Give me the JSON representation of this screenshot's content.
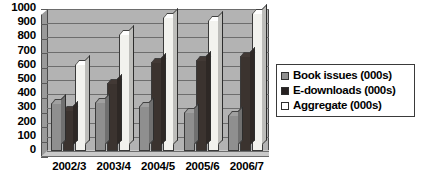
{
  "chart_data": {
    "type": "bar",
    "title": "",
    "subtitle": "",
    "xlabel": "",
    "ylabel": "",
    "ylim": [
      0,
      1000
    ],
    "ytick_step": 100,
    "yticks": [
      1000,
      900,
      800,
      700,
      600,
      500,
      400,
      300,
      200,
      100,
      0
    ],
    "ytick_labels": [
      "1000",
      "900",
      "800",
      "700",
      "600",
      "500",
      "400",
      "300",
      "200",
      "100",
      "0"
    ],
    "categories": [
      "2002/3",
      "2003/4",
      "2004/5",
      "2005/6",
      "2006/7"
    ],
    "grid": true,
    "grid_axis": "y",
    "legend_position": "right",
    "style": "3d-column",
    "series": [
      {
        "name": "Book issues (000s)",
        "color": "#8f8f8f",
        "values": [
          340,
          345,
          320,
          275,
          255
        ]
      },
      {
        "name": "E-downloads (000s)",
        "color": "#262020",
        "values": [
          290,
          480,
          625,
          640,
          670
        ]
      },
      {
        "name": "Aggregate (000s)",
        "color": "#ffffff",
        "values": [
          615,
          825,
          945,
          920,
          970
        ]
      }
    ]
  },
  "legend": {
    "items": [
      {
        "label": "Book issues (000s)",
        "swatch": "legend-swatch-book-issues"
      },
      {
        "label": "E-downloads (000s)",
        "swatch": "legend-swatch-e-downloads"
      },
      {
        "label": "Aggregate (000s)",
        "swatch": "legend-swatch-aggregate"
      }
    ]
  },
  "colors": {
    "plot_background": "#b3b3b3",
    "gridline": "#6d6d6d",
    "axis_text": "#000000",
    "figure_background": "#ffffff",
    "series_book_issues": "#8f8f8f",
    "series_e_downloads": "#262020",
    "series_aggregate": "#ffffff"
  }
}
